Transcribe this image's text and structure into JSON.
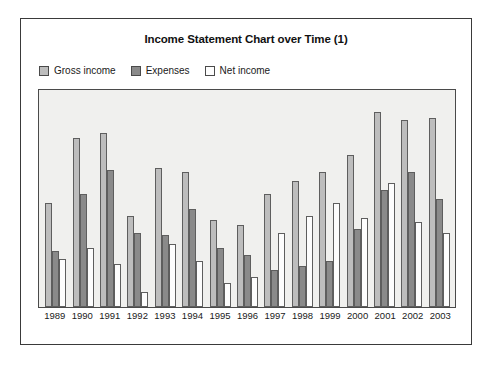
{
  "chart": {
    "title": "Income Statement Chart over Time (1)",
    "legend": [
      {
        "label": "Gross income",
        "color": "#bdbdbd",
        "key": "gross"
      },
      {
        "label": "Expenses",
        "color": "#8a8a8a",
        "key": "expenses"
      },
      {
        "label": "Net income",
        "color": "#fdfdfd",
        "key": "net"
      }
    ]
  },
  "chart_data": {
    "type": "bar",
    "title": "Income Statement Chart over Time (1)",
    "xlabel": "",
    "ylabel": "",
    "grid": false,
    "legend_position": "top-left",
    "ylim": [
      0,
      100
    ],
    "categories": [
      "1989",
      "1990",
      "1991",
      "1992",
      "1993",
      "1994",
      "1995",
      "1996",
      "1997",
      "1998",
      "1999",
      "2000",
      "2001",
      "2002",
      "2003"
    ],
    "series": [
      {
        "name": "Gross income",
        "color": "#bdbdbd",
        "values": [
          48,
          78,
          80,
          42,
          64,
          62,
          40,
          38,
          52,
          58,
          62,
          70,
          90,
          86,
          87
        ]
      },
      {
        "name": "Expenses",
        "color": "#8a8a8a",
        "values": [
          26,
          52,
          63,
          34,
          33,
          45,
          27,
          24,
          17,
          19,
          21,
          36,
          54,
          62,
          50
        ]
      },
      {
        "name": "Net income",
        "color": "#fdfdfd",
        "values": [
          22,
          27,
          20,
          7,
          29,
          21,
          11,
          14,
          34,
          42,
          48,
          41,
          57,
          39,
          34
        ]
      }
    ]
  }
}
